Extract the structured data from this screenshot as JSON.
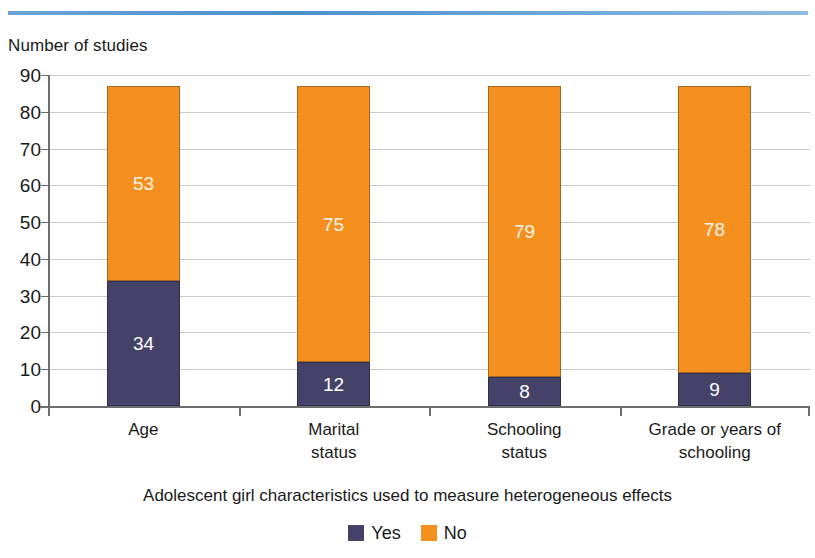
{
  "decoration": {
    "top_rule_color": "#5f9ed1"
  },
  "chart_data": {
    "type": "bar",
    "subtype": "stacked-vertical",
    "title": "",
    "ylabel": "Number of studies",
    "xlabel": "Adolescent girl characteristics used to measure heterogeneous effects",
    "categories": [
      "Age",
      "Marital status",
      "Schooling status",
      "Grade or years of schooling"
    ],
    "category_lines": [
      [
        "Age"
      ],
      [
        "Marital",
        "status"
      ],
      [
        "Schooling",
        "status"
      ],
      [
        "Grade or years of",
        "schooling"
      ]
    ],
    "series": [
      {
        "name": "Yes",
        "color": "#45426a",
        "values": [
          34,
          12,
          8,
          9
        ]
      },
      {
        "name": "No",
        "color": "#f5901e",
        "values": [
          53,
          75,
          79,
          78
        ]
      }
    ],
    "totals": [
      87,
      87,
      87,
      87
    ],
    "ylim": [
      0,
      90
    ],
    "ytick_step": 10,
    "yticks": [
      90,
      80,
      70,
      60,
      50,
      40,
      30,
      20,
      10,
      0
    ],
    "ytick_labels": [
      "90",
      "80",
      "70",
      "60",
      "50",
      "40",
      "30",
      "20",
      "10",
      "0"
    ],
    "grid": true,
    "grid_axis": "y",
    "legend_position": "bottom",
    "legend": [
      {
        "label": "Yes",
        "color": "#45426a"
      },
      {
        "label": "No",
        "color": "#f5901e"
      }
    ],
    "data_labels": {
      "Yes": [
        "34",
        "12",
        "8",
        "9"
      ],
      "No": [
        "53",
        "75",
        "79",
        "78"
      ]
    }
  }
}
